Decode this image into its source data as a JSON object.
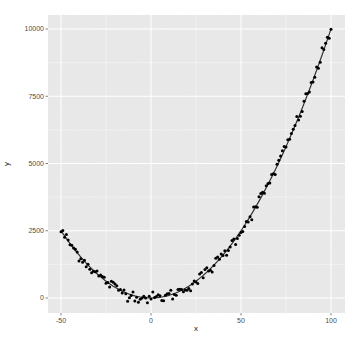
{
  "chart_data": {
    "type": "scatter",
    "title": "",
    "xlabel": "x",
    "ylabel": "y",
    "xlim": [
      -57,
      108
    ],
    "ylim": [
      -550,
      10500
    ],
    "x_ticks": [
      -50,
      0,
      50,
      100
    ],
    "x_tick_labels": [
      "-50",
      "0",
      "50",
      "100"
    ],
    "y_ticks": [
      0,
      2500,
      5000,
      7500,
      10000
    ],
    "y_tick_labels": [
      "0",
      "2500",
      "5000",
      "7500",
      "10000"
    ],
    "grid": true,
    "legend": "none",
    "series": [
      {
        "name": "points",
        "kind": "scatter",
        "relationship": "y = x^2 + noise",
        "x_range": [
          -50,
          100
        ],
        "n_points": 151,
        "noise_sd": 110,
        "color": "#000000",
        "x": [
          -50,
          -40,
          -30,
          -20,
          -10,
          0,
          10,
          20,
          30,
          40,
          50,
          60,
          70,
          80,
          90,
          100
        ],
        "y": [
          2600,
          1600,
          900,
          400,
          100,
          0,
          100,
          400,
          900,
          1600,
          2500,
          3600,
          4900,
          6400,
          8100,
          10000
        ]
      },
      {
        "name": "smooth",
        "kind": "line",
        "relationship": "y = x^2",
        "color": "#333333"
      }
    ]
  },
  "colors": {
    "panel_background": "#ebebeb",
    "grid_major": "#ffffff",
    "points": "#000000",
    "line": "#333333"
  }
}
